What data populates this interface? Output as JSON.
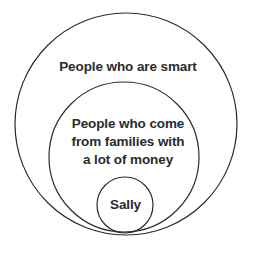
{
  "diagram": {
    "type": "euler-venn-nested",
    "background_color": "#ffffff",
    "stroke_color": "#2b2b2b",
    "text_color": "#2b2b2b",
    "sets": [
      {
        "id": "outer",
        "label": "People who are smart",
        "level": 1,
        "center_x": 126,
        "center_y": 124,
        "radius": 111
      },
      {
        "id": "middle",
        "label_lines": [
          "People who come",
          "from families with",
          "a lot of money"
        ],
        "label": "People who come from families with a lot of money",
        "level": 2,
        "center_x": 124,
        "center_y": 157,
        "radius": 75
      },
      {
        "id": "inner",
        "label": "Sally",
        "level": 3,
        "center_x": 125,
        "center_y": 205,
        "radius": 28
      }
    ]
  }
}
